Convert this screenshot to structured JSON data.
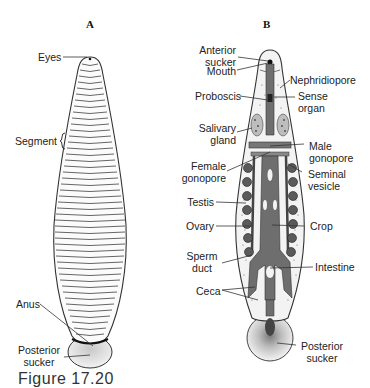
{
  "panels": {
    "a": {
      "letter": "A",
      "labels": {
        "eyes": "Eyes",
        "segment": "Segment",
        "anus": "Anus",
        "posterior_sucker_line1": "Posterior",
        "posterior_sucker_line2": "sucker"
      }
    },
    "b": {
      "letter": "B",
      "labels": {
        "anterior_sucker_line1": "Anterior",
        "anterior_sucker_line2": "sucker",
        "mouth": "Mouth",
        "nephridiopore": "Nephridiopore",
        "proboscis": "Proboscis",
        "sense_organ_line1": "Sense",
        "sense_organ_line2": "organ",
        "salivary_gland_line1": "Salivary",
        "salivary_gland_line2": "gland",
        "male_gonopore_line1": "Male",
        "male_gonopore_line2": "gonopore",
        "female_gonopore_line1": "Female",
        "female_gonopore_line2": "gonopore",
        "seminal_vesicle_line1": "Seminal",
        "seminal_vesicle_line2": "vesicle",
        "testis": "Testis",
        "crop": "Crop",
        "ovary": "Ovary",
        "sperm_duct_line1": "Sperm",
        "sperm_duct_line2": "duct",
        "intestine": "Intestine",
        "ceca": "Ceca",
        "posterior_sucker_line1": "Posterior",
        "posterior_sucker_line2": "sucker"
      }
    }
  },
  "caption": "Figure 17.20",
  "colors": {
    "gut": "#6e6e6e",
    "organ": "#555555",
    "body_fill": "#f4f4f4",
    "outline": "#333333"
  }
}
